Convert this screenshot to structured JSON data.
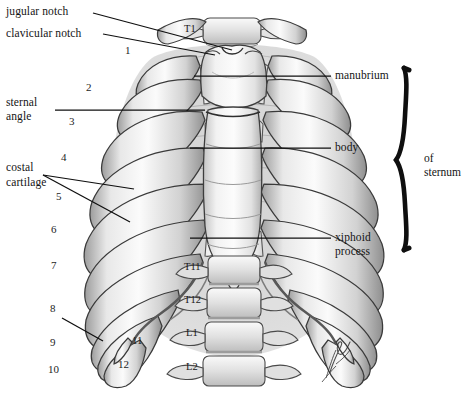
{
  "figure": {
    "background_color": "#ffffff",
    "ink_color": "#141414",
    "bone_light": "#f4f4f4",
    "bone_mid": "#c9c9c9",
    "bone_shadow": "#8e8e8e",
    "bone_dark": "#6e6e6e"
  },
  "callouts": {
    "jugular_notch": "jugular notch",
    "clavicular_notch": "clavicular notch",
    "sternal_angle_line1": "sternal",
    "sternal_angle_line2": "angle",
    "costal_cartilage_line1": "costal",
    "costal_cartilage_line2": "cartilage",
    "manubrium": "manubrium",
    "body": "body",
    "xiphoid_line1": "xiphoid",
    "xiphoid_line2": "process"
  },
  "brace": {
    "label_line1": "of",
    "label_line2": "sternum"
  },
  "rib_numbers": [
    "1",
    "2",
    "3",
    "4",
    "5",
    "6",
    "7",
    "8",
    "9",
    "10",
    "11",
    "12"
  ],
  "vertebrae": [
    "T1",
    "T11",
    "T12",
    "L1",
    "L2"
  ],
  "signature": "artist-signature"
}
